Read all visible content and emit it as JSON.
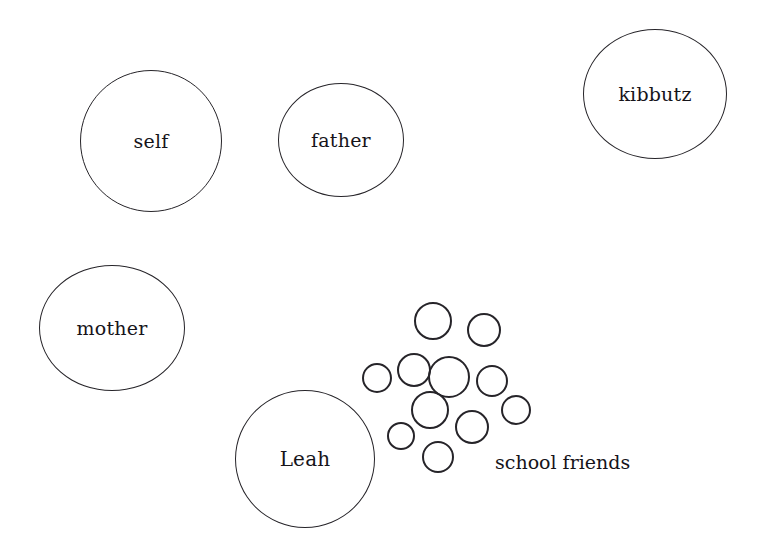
{
  "diagram": {
    "type": "sociogram",
    "title": "",
    "background_color": "#ffffff",
    "stroke_color": "#262429",
    "text_color": "#16141a",
    "canvas": {
      "width": 765,
      "height": 551
    },
    "nodes": [
      {
        "id": "self",
        "label": "self",
        "cx": 151,
        "cy": 141,
        "rx": 71,
        "ry": 71,
        "stroke_width": 1.5,
        "font_size": 19
      },
      {
        "id": "father",
        "label": "father",
        "cx": 341,
        "cy": 140,
        "rx": 63,
        "ry": 57,
        "stroke_width": 1.5,
        "font_size": 19
      },
      {
        "id": "kibbutz",
        "label": "kibbutz",
        "cx": 655,
        "cy": 94,
        "rx": 72,
        "ry": 65,
        "stroke_width": 1.5,
        "font_size": 19
      },
      {
        "id": "mother",
        "label": "mother",
        "cx": 112,
        "cy": 328,
        "rx": 73,
        "ry": 63,
        "stroke_width": 1.5,
        "font_size": 19
      },
      {
        "id": "leah",
        "label": "Leah",
        "cx": 305,
        "cy": 459,
        "rx": 70,
        "ry": 69,
        "stroke_width": 1.7,
        "font_size": 20
      }
    ],
    "cluster": {
      "id": "school-friends",
      "label": "school friends",
      "label_x": 495,
      "label_y": 453,
      "label_font_size": 19,
      "count": 11,
      "stroke_width": 2,
      "circles": [
        {
          "cx": 433,
          "cy": 321,
          "r": 19
        },
        {
          "cx": 484,
          "cy": 330,
          "r": 17
        },
        {
          "cx": 377,
          "cy": 378,
          "r": 15
        },
        {
          "cx": 414,
          "cy": 370,
          "r": 17
        },
        {
          "cx": 449,
          "cy": 377,
          "r": 21
        },
        {
          "cx": 492,
          "cy": 381,
          "r": 16
        },
        {
          "cx": 430,
          "cy": 410,
          "r": 19
        },
        {
          "cx": 516,
          "cy": 410,
          "r": 15
        },
        {
          "cx": 472,
          "cy": 427,
          "r": 17
        },
        {
          "cx": 401,
          "cy": 436,
          "r": 14
        },
        {
          "cx": 438,
          "cy": 457,
          "r": 16
        }
      ]
    }
  }
}
